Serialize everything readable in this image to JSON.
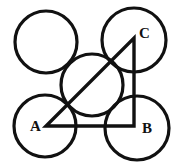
{
  "diagram": {
    "type": "geometry",
    "stroke_color": "#111111",
    "background": "#ffffff",
    "circles": [
      {
        "id": "top-left",
        "cx": 46,
        "cy": 42,
        "r": 31
      },
      {
        "id": "top-right",
        "cx": 134,
        "cy": 40,
        "r": 32
      },
      {
        "id": "center",
        "cx": 92,
        "cy": 85,
        "r": 31
      },
      {
        "id": "bottom-left",
        "cx": 45,
        "cy": 126,
        "r": 31
      },
      {
        "id": "bottom-right",
        "cx": 137,
        "cy": 128,
        "r": 32
      }
    ],
    "triangle": {
      "vertices": {
        "A": {
          "x": 46,
          "y": 126
        },
        "B": {
          "x": 134,
          "y": 126
        },
        "C": {
          "x": 134,
          "y": 38
        }
      },
      "right_angle_at": "B"
    },
    "labels": {
      "A": {
        "text": "A",
        "x": 30,
        "y": 131
      },
      "B": {
        "text": "B",
        "x": 142,
        "y": 133
      },
      "C": {
        "text": "C",
        "x": 139,
        "y": 38
      }
    }
  }
}
